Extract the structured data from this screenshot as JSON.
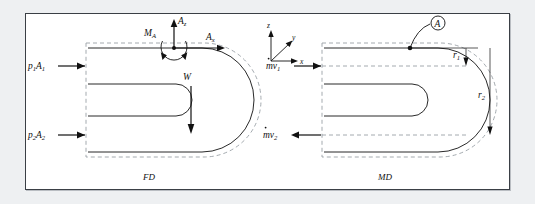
{
  "figure": {
    "background_color": "#ffffff",
    "page_color": "#eef0f2",
    "border_color": "#3a3f45",
    "line_color": "#111111",
    "dashed_color": "#9aa0a6"
  },
  "force_diagram": {
    "caption": "FD",
    "labels": {
      "inlet_pressure_force": "p",
      "inlet_pressure_force_sub1": "1",
      "inlet_pressure_force_area": "A",
      "inlet_pressure_force_sub2": "1",
      "outlet_pressure_force": "p",
      "outlet_pressure_force_sub1": "2",
      "outlet_pressure_force_area": "A",
      "outlet_pressure_force_sub2": "2",
      "reaction_vertical": "A",
      "reaction_vertical_sub": "z",
      "reaction_horizontal": "A",
      "reaction_horizontal_sub": "x",
      "moment": "M",
      "moment_sub": "A",
      "weight": "W"
    }
  },
  "momentum_diagram": {
    "caption": "MD",
    "labels": {
      "inlet_momentum": "mv",
      "inlet_momentum_sub": "1",
      "outlet_momentum": "mv",
      "outlet_momentum_sub": "2",
      "radius_inner": "r",
      "radius_inner_sub": "1",
      "radius_outer": "r",
      "radius_outer_sub": "2",
      "point_marker": "A"
    }
  },
  "coordinate_axes": {
    "x": "x",
    "y": "y",
    "z": "z"
  }
}
